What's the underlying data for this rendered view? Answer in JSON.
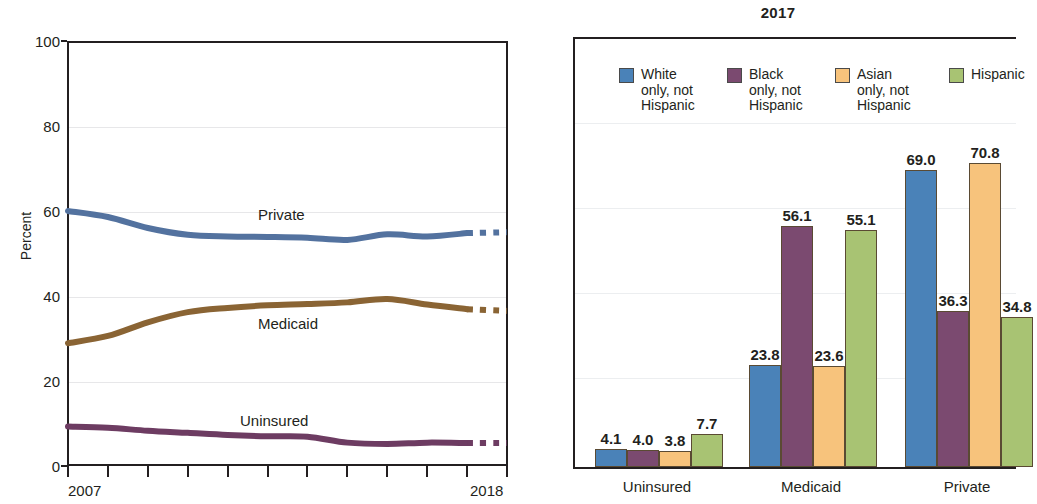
{
  "left_chart": {
    "ylabel": "Percent",
    "yticks": [
      "0",
      "20",
      "40",
      "60",
      "80",
      "100"
    ],
    "xtick_first": "2007",
    "xtick_last": "2018",
    "series_labels": {
      "private": "Private",
      "medicaid": "Medicaid",
      "uninsured": "Uninsured"
    },
    "colors": {
      "private": "#53729f",
      "medicaid": "#8a6434",
      "uninsured": "#6d3c62"
    }
  },
  "right_chart": {
    "title": "2017",
    "legend": [
      {
        "label": "White\nonly, not\nHispanic",
        "color": "#4a82b8"
      },
      {
        "label": "Black\nonly, not\nHispanic",
        "color": "#7b4a70"
      },
      {
        "label": "Asian\nonly, not\nHispanic",
        "color": "#f7c37c"
      },
      {
        "label": "Hispanic",
        "color": "#a8c373"
      }
    ],
    "group_labels": [
      "Uninsured",
      "Medicaid",
      "Private"
    ],
    "values": {
      "uninsured": [
        "4.1",
        "4.0",
        "3.8",
        "7.7"
      ],
      "medicaid": [
        "23.8",
        "56.1",
        "23.6",
        "55.1"
      ],
      "private": [
        "69.0",
        "36.3",
        "70.8",
        "34.8"
      ]
    }
  },
  "chart_data": [
    {
      "type": "line",
      "title": "",
      "xlabel": "",
      "ylabel": "Percent",
      "ylim": [
        0,
        100
      ],
      "yticks": [
        0,
        20,
        40,
        60,
        80,
        100
      ],
      "x": [
        2007,
        2008,
        2009,
        2010,
        2011,
        2012,
        2013,
        2014,
        2015,
        2016,
        2017,
        2018
      ],
      "xlim": [
        2007,
        2018
      ],
      "grid": true,
      "legend": "inline-labels",
      "annotations": [
        "Private",
        "Medicaid",
        "Uninsured"
      ],
      "note": "Final segment of each line (2017-2018) is drawn dashed",
      "series": [
        {
          "name": "Private",
          "color": "#53729f",
          "values": [
            60.0,
            58.6,
            56.0,
            54.4,
            54.0,
            53.9,
            53.7,
            53.2,
            54.5,
            54.0,
            54.8,
            55.0
          ]
        },
        {
          "name": "Medicaid",
          "color": "#8a6434",
          "values": [
            28.9,
            30.6,
            33.8,
            36.2,
            37.2,
            37.8,
            38.1,
            38.5,
            39.3,
            38.0,
            36.9,
            36.5
          ]
        },
        {
          "name": "Uninsured",
          "color": "#6d3c62",
          "values": [
            9.3,
            9.0,
            8.3,
            7.8,
            7.3,
            7.0,
            6.9,
            5.5,
            5.2,
            5.5,
            5.4,
            5.4
          ]
        }
      ]
    },
    {
      "type": "bar",
      "title": "2017",
      "xlabel": "",
      "ylabel": "Percent",
      "ylim": [
        0,
        100
      ],
      "grid": true,
      "legend": "top-inside",
      "categories": [
        "Uninsured",
        "Medicaid",
        "Private"
      ],
      "series": [
        {
          "name": "White only, not Hispanic",
          "color": "#4a82b8",
          "values": [
            4.1,
            23.8,
            69.0
          ]
        },
        {
          "name": "Black only, not Hispanic",
          "color": "#7b4a70",
          "values": [
            4.0,
            56.1,
            36.3
          ]
        },
        {
          "name": "Asian only, not Hispanic",
          "color": "#f7c37c",
          "values": [
            3.8,
            23.6,
            70.8
          ]
        },
        {
          "name": "Hispanic",
          "color": "#a8c373",
          "values": [
            7.7,
            55.1,
            34.8
          ]
        }
      ]
    }
  ]
}
